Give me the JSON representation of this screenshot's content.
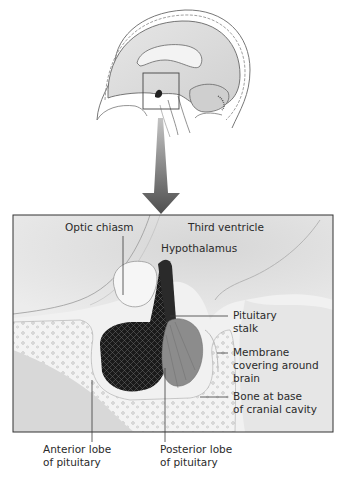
{
  "figure": {
    "type": "anatomical diagram",
    "overview": {
      "description": "Sagittal section of head and brain with a small square highlighting the pituitary region",
      "highlight_box": {
        "x": 143,
        "y": 73,
        "width": 36,
        "height": 36
      }
    },
    "arrow": {
      "color_top": "#b0b0b0",
      "color_bottom": "#555555"
    },
    "detail_frame": {
      "x": 13,
      "y": 215,
      "width": 320,
      "height": 217
    }
  },
  "labels": {
    "optic_chiasm": "Optic chiasm",
    "third_ventricle": "Third ventricle",
    "hypothalamus": "Hypothalamus",
    "pituitary_stalk": [
      "Pituitary",
      "stalk"
    ],
    "membrane": [
      "Membrane",
      "covering around",
      "brain"
    ],
    "bone": [
      "Bone at base",
      "of cranial cavity"
    ],
    "anterior_lobe": [
      "Anterior lobe",
      "of pituitary"
    ],
    "posterior_lobe": [
      "Posterior lobe",
      "of pituitary"
    ]
  },
  "colors": {
    "line": "#3a3a3a",
    "tissue_light": "#e4e4e4",
    "tissue_mid": "#c8c8c8",
    "anterior_lobe": "#1c1c1c",
    "posterior_lobe": "#8a8a8a",
    "bone": "#f2f2f2"
  }
}
